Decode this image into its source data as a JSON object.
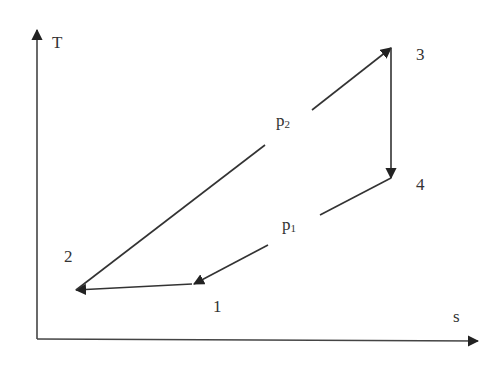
{
  "diagram": {
    "type": "T-s diagram (thermodynamic cycle)",
    "axes": {
      "y_label": "T",
      "x_label": "s"
    },
    "points": [
      {
        "id": "1",
        "label": "1"
      },
      {
        "id": "2",
        "label": "2"
      },
      {
        "id": "3",
        "label": "3"
      },
      {
        "id": "4",
        "label": "4"
      }
    ],
    "isobars": {
      "high": {
        "label": "p",
        "subscript": "2"
      },
      "low": {
        "label": "p",
        "subscript": "1"
      }
    },
    "process_path": [
      "1",
      "2",
      "3",
      "4",
      "1"
    ],
    "colors": {
      "line": "#333333",
      "text": "#333333",
      "background": "#ffffff"
    }
  }
}
